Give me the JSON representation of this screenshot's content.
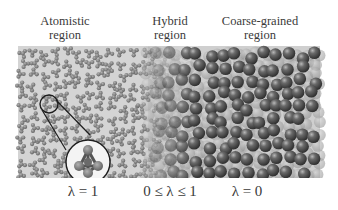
{
  "regions": [
    {
      "name": "atomistic",
      "line1": "Atomistic",
      "line2": "region",
      "lambda_label": "λ = 1"
    },
    {
      "name": "hybrid",
      "line1": "Hybrid",
      "line2": "region",
      "lambda_label": "0 ≤ λ ≤ 1"
    },
    {
      "name": "coarse-grained",
      "line1": "Coarse-grained",
      "line2": "region",
      "lambda_label": "λ = 0"
    }
  ],
  "colors": {
    "atomistic_fill": "#8a8a8a",
    "cg_sphere": "#5a5a5a",
    "cg_highlight": "#bdbdbd",
    "outline": "#222222"
  },
  "inset": {
    "description": "magnified tetrahedral molecule",
    "icon": "tetrahedral-molecule-icon"
  }
}
